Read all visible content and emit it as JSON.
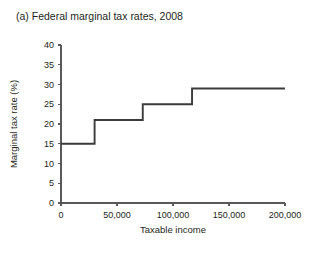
{
  "chart_data": {
    "type": "line",
    "title": "(a) Federal marginal tax rates, 2008",
    "xlabel": "Taxable income",
    "ylabel": "Marginal tax rate (%)",
    "xlim": [
      0,
      200000
    ],
    "ylim": [
      0,
      40
    ],
    "grid": false,
    "legend": "none",
    "step_style": "post",
    "xticks": [
      0,
      50000,
      100000,
      150000,
      200000
    ],
    "xtick_labels": [
      "0",
      "50,000",
      "100,000",
      "150,000",
      "200,000"
    ],
    "yticks": [
      0,
      5,
      10,
      15,
      20,
      25,
      30,
      35,
      40
    ],
    "ytick_labels": [
      "0",
      "5",
      "10",
      "15",
      "20",
      "25",
      "30",
      "35",
      "40"
    ],
    "series": [
      {
        "name": "Federal marginal tax rate",
        "color": "#3b3b3d",
        "x": [
          0,
          30000,
          30000,
          73000,
          73000,
          117000,
          117000,
          200000
        ],
        "y": [
          15,
          15,
          21,
          21,
          25,
          25,
          29,
          29
        ]
      }
    ],
    "brackets": [
      {
        "income_start": 0,
        "income_end": 30000,
        "rate": 15
      },
      {
        "income_start": 30000,
        "income_end": 73000,
        "rate": 21
      },
      {
        "income_start": 73000,
        "income_end": 117000,
        "rate": 25
      },
      {
        "income_start": 117000,
        "income_end": 200000,
        "rate": 29
      }
    ]
  }
}
